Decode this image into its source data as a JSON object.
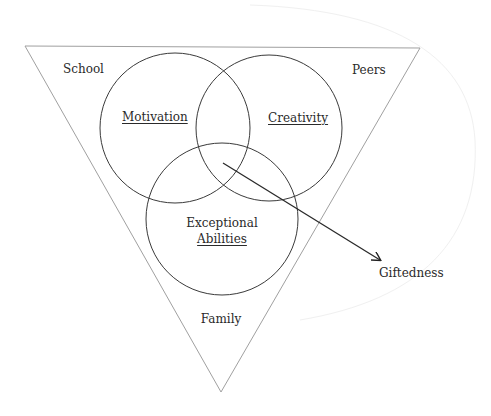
{
  "diagram": {
    "context_labels": {
      "top_left": "School",
      "top_right": "Peers",
      "bottom": "Family"
    },
    "circles": [
      {
        "label": "Motivation",
        "underlined": true
      },
      {
        "label": "Creativity",
        "underlined": true
      },
      {
        "label_line1": "Exceptional",
        "label_line2": "Abilities",
        "underlined": true
      }
    ],
    "outcome": {
      "label": "Giftedness"
    },
    "colors": {
      "stroke": "#3a3a3a",
      "triangle": "#9a9a9a",
      "text": "#2a2a2a",
      "background": "#ffffff"
    }
  }
}
